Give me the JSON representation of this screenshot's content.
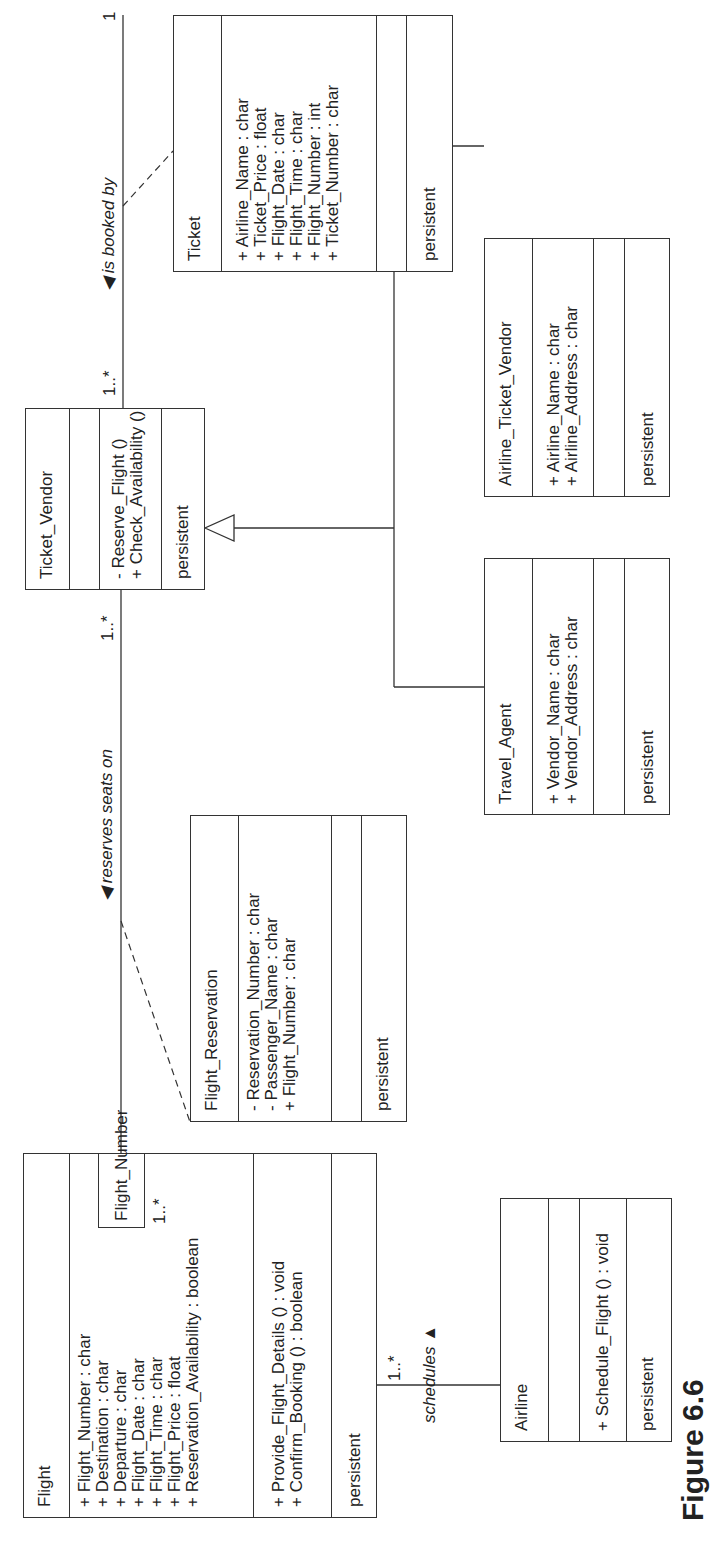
{
  "diagram": {
    "type": "UML class diagram",
    "orientation": "rotated 90 degrees counter-clockwise",
    "classes": {
      "flight": {
        "name": "Flight",
        "attributes": [
          "+ Flight_Number : char",
          "+ Destination : char",
          "+ Departure : char",
          "+ Flight_Date : char",
          "+ Flight_Time : char",
          "+ Flight_Price : float",
          "+ Reservation_Availability : boolean"
        ],
        "operations": [
          "+ Provide_Flight_Details () : void",
          "+ Confirm_Booking () : boolean"
        ],
        "stereotype": "persistent"
      },
      "flight_number": {
        "name": "Flight_Number"
      },
      "flight_reservation": {
        "name": "Flight_Reservation",
        "attributes": [
          "- Reservation_Number : char",
          "- Passenger_Name : char",
          "+ Flight_Number : char"
        ],
        "operations": [],
        "stereotype": "persistent"
      },
      "ticket_vendor": {
        "name": "Ticket_Vendor",
        "attributes": [],
        "operations": [
          "- Reserve_Flight ()",
          "+ Check_Availability ()"
        ],
        "stereotype": "persistent"
      },
      "ticket": {
        "name": "Ticket",
        "attributes": [
          "+ Airline_Name : char",
          "+ Ticket_Price : float",
          "+ Flight_Date : char",
          "+ Flight_Time : char",
          "+ Flight_Number : int",
          "+ Ticket_Number : char"
        ],
        "operations": [],
        "stereotype": "persistent"
      },
      "travel_agent": {
        "name": "Travel_Agent",
        "attributes": [
          "+ Vendor_Name : char",
          "+ Vendor_Address : char"
        ],
        "operations": [],
        "stereotype": "persistent"
      },
      "airline_ticket_vendor": {
        "name": "Airline_Ticket_Vendor",
        "attributes": [
          "+ Airline_Name : char",
          "+ Airline_Address : char"
        ],
        "operations": [],
        "stereotype": "persistent"
      },
      "airline": {
        "name": "Airline",
        "attributes": [],
        "operations": [
          "+ Schedule_Flight () : void"
        ],
        "stereotype": "persistent"
      }
    },
    "associations": {
      "reserves": {
        "label": "◀ reserves seats on",
        "mult_flight": "1..*",
        "mult_vendor": "1..*"
      },
      "booked": {
        "label": "◀ is booked by",
        "mult_vendor": "1..*",
        "mult_ticket": "1"
      },
      "schedules": {
        "label": "schedules ▲",
        "mult_flight": "1..*"
      }
    },
    "caption": "Figure 6.6"
  }
}
